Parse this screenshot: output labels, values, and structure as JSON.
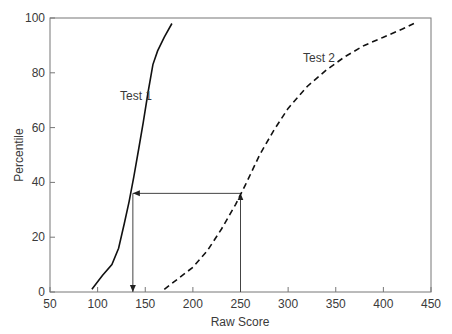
{
  "chart_data": {
    "type": "line",
    "title": "",
    "xlabel": "Raw Score",
    "ylabel": "Percentile",
    "xlim": [
      50,
      450
    ],
    "ylim": [
      0,
      100
    ],
    "xticks": [
      50,
      100,
      150,
      200,
      250,
      300,
      350,
      400,
      450
    ],
    "yticks": [
      0,
      20,
      40,
      60,
      80,
      100
    ],
    "grid": false,
    "legend": "none (inline labels)",
    "series": [
      {
        "name": "Test 1",
        "style": "solid",
        "x": [
          94,
          105,
          115,
          122,
          128,
          133,
          138,
          143,
          148,
          153,
          158,
          163,
          170,
          178
        ],
        "y": [
          1,
          6,
          10,
          16,
          25,
          33,
          42,
          52,
          62,
          73,
          83,
          88,
          93,
          98
        ]
      },
      {
        "name": "Test 2",
        "style": "dashed",
        "x": [
          170,
          185,
          200,
          215,
          230,
          245,
          255,
          270,
          285,
          300,
          320,
          340,
          360,
          380,
          400,
          420,
          432
        ],
        "y": [
          1,
          5,
          9,
          15,
          23,
          32,
          39,
          50,
          59,
          67,
          75,
          81,
          86,
          90,
          93,
          96,
          98
        ]
      }
    ],
    "annotations": [
      {
        "type": "vertical-arrow-up",
        "x": 250,
        "from_y": 0,
        "to_y": 36
      },
      {
        "type": "horizontal-arrow-left",
        "y": 36,
        "from_x": 250,
        "to_x": 137
      },
      {
        "type": "vertical-arrow-down",
        "x": 137,
        "from_y": 36,
        "to_y": 0
      },
      {
        "type": "label",
        "text": "Test 1",
        "x": 110,
        "y": 69
      },
      {
        "type": "label",
        "text": "Test 2",
        "x": 330,
        "y": 86
      }
    ]
  },
  "labels": {
    "xlabel": "Raw Score",
    "ylabel": "Percentile",
    "test1": "Test 1",
    "test2": "Test 2"
  }
}
